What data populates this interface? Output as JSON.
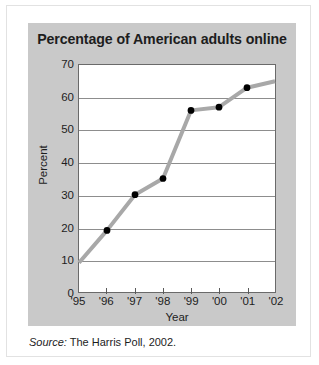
{
  "chart_data": {
    "type": "line",
    "title": "Percentage of American adults online",
    "xlabel": "Year",
    "ylabel": "Percent",
    "categories": [
      "'95",
      "'96",
      "'97",
      "'98",
      "'99",
      "'00",
      "'01",
      "'02"
    ],
    "x": [
      1995,
      1996,
      1997,
      1998,
      1999,
      2000,
      2001,
      2002
    ],
    "values": [
      9,
      19,
      30,
      35,
      56,
      57,
      63,
      65
    ],
    "markers": [
      false,
      true,
      true,
      true,
      true,
      true,
      true,
      false
    ],
    "ylim": [
      0,
      70
    ],
    "ytick_labels": [
      "70",
      "60",
      "50",
      "40",
      "30",
      "20",
      "10",
      "0"
    ],
    "yticks": [
      70,
      60,
      50,
      40,
      30,
      20,
      10,
      0
    ],
    "grid": true,
    "legend": "none",
    "line_color": "#a8a8a8",
    "marker_color": "#000000",
    "panel_color": "#c9c9c9",
    "plot_bg_color": "#ffffff"
  },
  "source": {
    "label": "Source:",
    "text": "The Harris Poll, 2002."
  }
}
